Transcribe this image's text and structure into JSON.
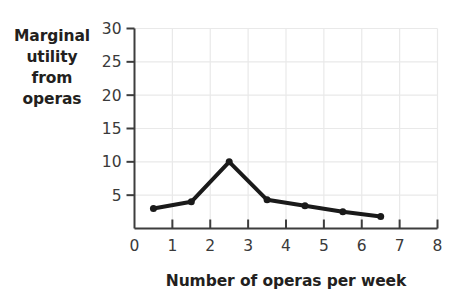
{
  "chart_data": {
    "type": "line",
    "title": "",
    "subtitle": "",
    "xlabel": "Number of operas per week",
    "ylabel": "Marginal utility from operas",
    "ylabel_lines": [
      "Marginal",
      "utility",
      "from",
      "operas"
    ],
    "x": [
      0.5,
      1.5,
      2.5,
      3.5,
      4.5,
      5.5,
      6.5
    ],
    "values": [
      3,
      4,
      10,
      4.3,
      3.4,
      2.5,
      1.8
    ],
    "series": [
      {
        "name": "Marginal utility from operas",
        "x": [
          0.5,
          1.5,
          2.5,
          3.5,
          4.5,
          5.5,
          6.5
        ],
        "values": [
          3,
          4,
          10,
          4.3,
          3.4,
          2.5,
          1.8
        ]
      }
    ],
    "xlim": [
      0,
      8
    ],
    "ylim": [
      0,
      30
    ],
    "xticks": [
      0,
      1,
      2,
      3,
      4,
      5,
      6,
      7,
      8
    ],
    "yticks": [
      0,
      5,
      10,
      15,
      20,
      25,
      30
    ],
    "xtick_labels": [
      "0",
      "1",
      "2",
      "3",
      "4",
      "5",
      "6",
      "7",
      "8"
    ],
    "ytick_labels": [
      "5",
      "10",
      "15",
      "20",
      "25",
      "30"
    ],
    "grid": true,
    "grid_x_step": 1,
    "grid_y_step": 5,
    "legend": false,
    "legend_position": "none",
    "annotations": [],
    "colors": {
      "line": "#1a1a1a",
      "marker": "#1a1a1a",
      "grid": "#e9e9e9",
      "axis": "#3d3d3d",
      "text": "#231f20",
      "tick_text": "#3a3a3a",
      "background": "#ffffff"
    },
    "marker": "circle",
    "marker_size": 7,
    "line_width": 4
  }
}
